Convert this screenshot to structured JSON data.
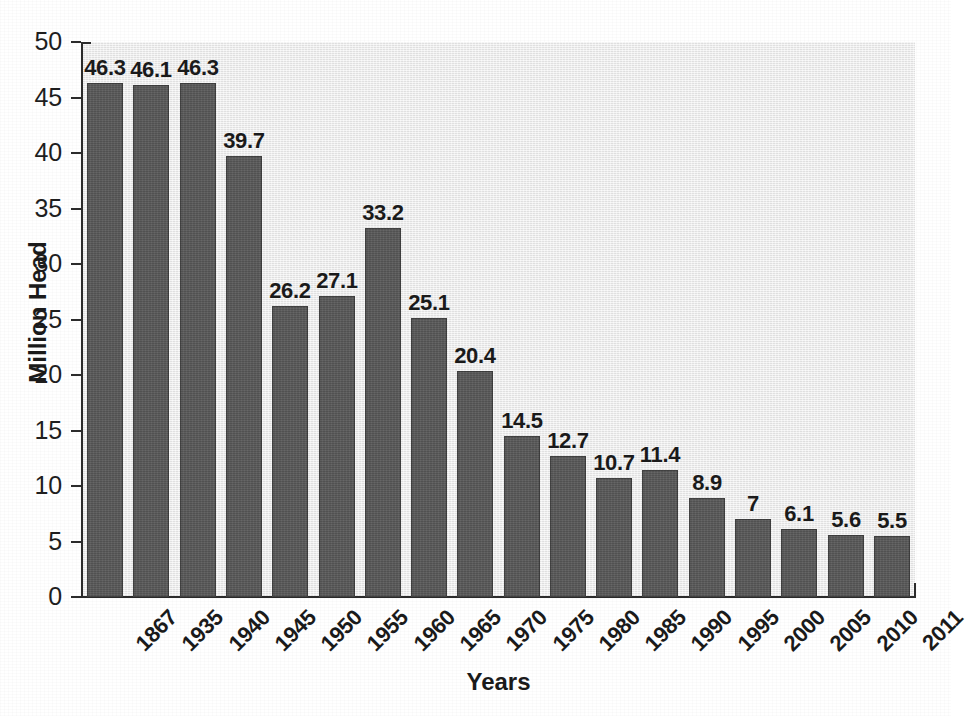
{
  "chart_data": {
    "type": "bar",
    "title": "",
    "xlabel": "Years",
    "ylabel": "Million Head",
    "categories": [
      "1867",
      "1935",
      "1940",
      "1945",
      "1950",
      "1955",
      "1960",
      "1965",
      "1970",
      "1975",
      "1980",
      "1985",
      "1990",
      "1995",
      "2000",
      "2005",
      "2010",
      "2011"
    ],
    "values": [
      46.3,
      46.1,
      46.3,
      39.7,
      26.2,
      27.1,
      33.2,
      25.1,
      20.4,
      14.5,
      12.7,
      10.7,
      11.4,
      8.9,
      7,
      6.1,
      5.6,
      5.5
    ],
    "data_labels": [
      "46.3",
      "46.1",
      "46.3",
      "39.7",
      "26.2",
      "27.1",
      "33.2",
      "25.1",
      "20.4",
      "14.5",
      "12.7",
      "10.7",
      "11.4",
      "8.9",
      "7",
      "6.1",
      "5.6",
      "5.5"
    ],
    "ylim": [
      0,
      50
    ],
    "yticks": [
      0,
      5,
      10,
      15,
      20,
      25,
      30,
      35,
      40,
      45,
      50
    ],
    "ytick_labels": [
      "0",
      "5",
      "10",
      "15",
      "20",
      "25",
      "30",
      "35",
      "40",
      "45",
      "50"
    ],
    "grid": false,
    "legend": null,
    "legend_position": "none",
    "bar_color": "#585858",
    "plot_background_color": "#ebebeb",
    "axis_color": "#2b2b2b",
    "text_color": "#1a1a1a",
    "xtick_label_rotation": -45,
    "bar_count": 18,
    "annotations": []
  },
  "axes": {
    "y_title": "Million Head",
    "x_title": "Years"
  }
}
